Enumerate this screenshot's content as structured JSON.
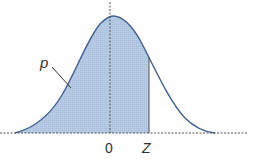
{
  "diagram": {
    "labels": {
      "area": "p",
      "origin": "0",
      "z": "Z"
    },
    "colors": {
      "fill": "#b8cbe4",
      "curve": "#3d5f8f",
      "axis": "#555555",
      "text": "#333333"
    }
  }
}
